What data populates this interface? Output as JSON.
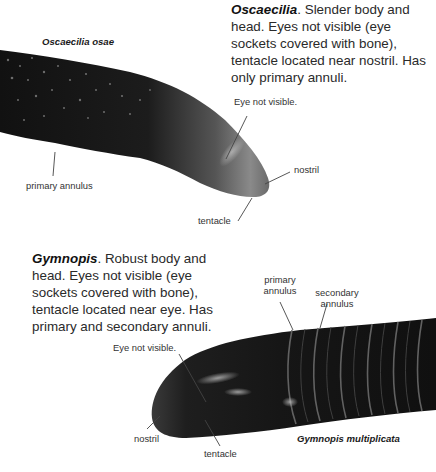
{
  "figure": {
    "top_specimen": {
      "species_label": "Oscaecilia osae",
      "caption_genus": "Oscaecilia",
      "caption_text": ". Slender body and head. Eyes not visible (eye sockets covered with bone), tentacle located near nostril. Has only primary annuli.",
      "labels": {
        "eye": "Eye not visible.",
        "nostril": "nostril",
        "tentacle": "tentacle",
        "primary_annulus": "primary annulus"
      }
    },
    "bottom_specimen": {
      "species_label": "Gymnopis multiplicata",
      "caption_genus": "Gymnopis",
      "caption_text": ". Robust body and head. Eyes not visible (eye sockets covered with bone), tentacle located near eye. Has primary and secondary annuli.",
      "labels": {
        "eye": "Eye not visible.",
        "nostril": "nostril",
        "tentacle": "tentacle",
        "primary_annulus_line1": "primary",
        "primary_annulus_line2": "annulus",
        "secondary_annulus_line1": "secondary",
        "secondary_annulus_line2": "annulus"
      }
    },
    "colors": {
      "background": "#ffffff",
      "body_dark": "#151515",
      "leader_line": "#444444",
      "text": "#2a2a2a"
    }
  }
}
